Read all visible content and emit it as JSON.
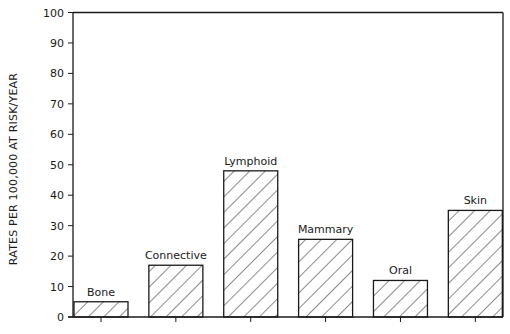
{
  "chart_data": {
    "type": "bar",
    "title": "",
    "xlabel": "",
    "ylabel": "RATES PER 100,000 AT RISK/YEAR",
    "categories": [
      "Bone",
      "Connective",
      "Lymphoid",
      "Mammary",
      "Oral",
      "Skin"
    ],
    "values": [
      5,
      17,
      48,
      25.5,
      12,
      35
    ],
    "ylim": [
      0,
      100
    ],
    "yticks": [
      0,
      10,
      20,
      30,
      40,
      50,
      60,
      70,
      80,
      90,
      100
    ],
    "grid": false,
    "legend": null,
    "bar_fill": "diagonal-hatch",
    "bar_labels_above": true,
    "colors": {
      "ink": "#1a1a1a",
      "background": "#ffffff"
    }
  },
  "caption": {
    "visible": "clipped",
    "text": ""
  }
}
